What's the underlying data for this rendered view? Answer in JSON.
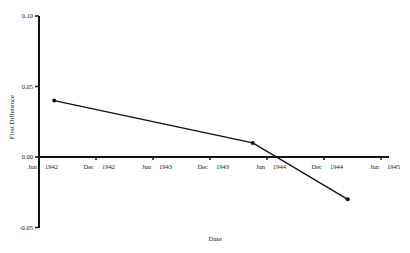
{
  "chart_data": {
    "type": "line",
    "title": "",
    "xlabel": "Date",
    "ylabel": "First Difference",
    "ylim": [
      -0.05,
      0.1
    ],
    "yticks": [
      0.1,
      0.05,
      0.0,
      -0.05
    ],
    "ytick_labels": [
      "0.10",
      "0.05",
      "0.00",
      "-0.05"
    ],
    "xticks": [
      {
        "month": "Jun",
        "year": "1942"
      },
      {
        "month": "Dec",
        "year": "1942"
      },
      {
        "month": "Jun",
        "year": "1943"
      },
      {
        "month": "Dec",
        "year": "1943"
      },
      {
        "month": "Jun",
        "year": "1944"
      },
      {
        "month": "Dec",
        "year": "1944"
      },
      {
        "month": "Jun",
        "year": "1945"
      }
    ],
    "grid": false,
    "legend": null,
    "series": [
      {
        "name": "First Difference",
        "points": [
          {
            "x": "Aug 1942",
            "months_from_jun_1942": 1.6,
            "y": 0.04
          },
          {
            "x": "May 1944",
            "months_from_jun_1942": 22.5,
            "y": 0.01
          },
          {
            "x": "Mar 1945",
            "months_from_jun_1942": 32.5,
            "y": -0.03
          }
        ]
      }
    ]
  }
}
